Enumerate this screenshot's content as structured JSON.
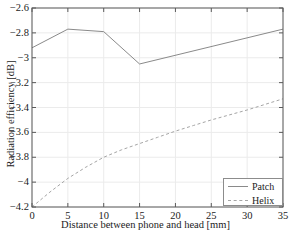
{
  "chart_data": {
    "type": "line",
    "title": "",
    "xlabel": "Distance between phone and head [mm]",
    "ylabel": "Radiation efficiency [dB]",
    "xlim": [
      0,
      35
    ],
    "ylim": [
      -4.2,
      -2.6
    ],
    "xticks": [
      "0",
      "5",
      "10",
      "15",
      "20",
      "25",
      "30",
      "35"
    ],
    "xtick_values": [
      0,
      5,
      10,
      15,
      20,
      25,
      30,
      35
    ],
    "yticks": [
      "-4.2",
      "-4",
      "-3.8",
      "-3.6",
      "-3.4",
      "-3.2",
      "-3",
      "-2.8",
      "-2.6"
    ],
    "ytick_values": [
      -4.2,
      -4.0,
      -3.8,
      -3.6,
      -3.4,
      -3.2,
      -3.0,
      -2.8,
      -2.6
    ],
    "grid": true,
    "legend_position": "lower right",
    "series": [
      {
        "name": "Patch",
        "style": "solid",
        "color": "#8a8a8a",
        "x": [
          0,
          5,
          10,
          15,
          35
        ],
        "values": [
          -2.92,
          -2.77,
          -2.79,
          -3.05,
          -2.77
        ]
      },
      {
        "name": "Helix",
        "style": "dashed",
        "color": "#a5a5a5",
        "x": [
          0,
          2.5,
          5,
          7.5,
          10,
          12.5,
          15,
          17.5,
          20,
          22.5,
          25,
          27.5,
          30,
          32.5,
          35
        ],
        "values": [
          -4.2,
          -4.08,
          -3.97,
          -3.88,
          -3.8,
          -3.74,
          -3.69,
          -3.64,
          -3.59,
          -3.545,
          -3.5,
          -3.46,
          -3.42,
          -3.375,
          -3.33
        ]
      }
    ]
  },
  "legend": {
    "entries": [
      {
        "label": "Patch",
        "style": "solid"
      },
      {
        "label": "Helix",
        "style": "dashed"
      }
    ]
  },
  "colors": {
    "axis": "#4d4d4d",
    "grid": "#ebebeb",
    "patch": "#8a8a8a",
    "helix": "#a5a5a5",
    "background": "#ffffff"
  }
}
